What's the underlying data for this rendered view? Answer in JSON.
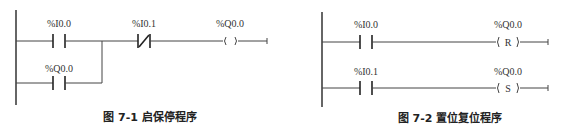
{
  "figures": [
    {
      "caption": "图 7-1   启保停程序",
      "rungs": [
        {
          "contact": "%I0.0",
          "contact_type": "NO",
          "series_contact": "%I0.1",
          "series_type": "NC",
          "coil": "%Q0.0",
          "coil_symbol": "(   )"
        },
        {
          "contact": "%Q0.0",
          "contact_type": "NO",
          "parallel_with": 0
        }
      ]
    },
    {
      "caption": "图 7-2   置位复位程序",
      "rungs": [
        {
          "contact": "%I0.0",
          "contact_type": "NO",
          "coil": "%Q0.0",
          "coil_symbol": "( R )"
        },
        {
          "contact": "%I0.1",
          "contact_type": "NO",
          "coil": "%Q0.0",
          "coil_symbol": "( S )"
        }
      ]
    }
  ]
}
